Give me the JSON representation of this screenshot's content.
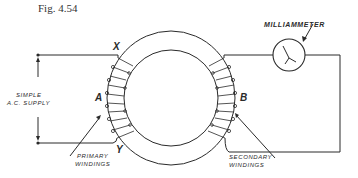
{
  "figure": {
    "caption": "Fig. 4.54",
    "type": "toroidal transformer circuit diagram"
  },
  "labels": {
    "point_x": "X",
    "point_y": "Y",
    "coil_a": "A",
    "coil_b": "B",
    "supply_line1": "SIMPLE",
    "supply_line2": "A.C. SUPPLY",
    "primary_line1": "PRIMARY",
    "primary_line2": "WINDINGS",
    "secondary_line1": "SECONDARY",
    "secondary_line2": "WINDINGS",
    "meter": "MILLIAMMETER"
  },
  "colors": {
    "ink": "#2a2a2a",
    "background": "#ffffff"
  }
}
